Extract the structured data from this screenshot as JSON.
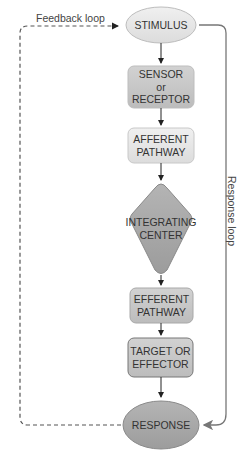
{
  "diagram": {
    "nodes": [
      {
        "id": "stimulus",
        "label": "STIMULUS",
        "shape": "ellipse"
      },
      {
        "id": "sensor",
        "label_lines": [
          "SENSOR",
          "or",
          "RECEPTOR"
        ],
        "shape": "rounded-rect"
      },
      {
        "id": "afferent",
        "label_lines": [
          "AFFERENT",
          "PATHWAY"
        ],
        "shape": "rounded-rect"
      },
      {
        "id": "integrating",
        "label_lines": [
          "INTEGRATING",
          "CENTER"
        ],
        "shape": "diamond"
      },
      {
        "id": "efferent",
        "label_lines": [
          "EFFERENT",
          "PATHWAY"
        ],
        "shape": "rounded-rect"
      },
      {
        "id": "target",
        "label_lines": [
          "TARGET OR",
          "EFFECTOR"
        ],
        "shape": "rounded-rect"
      },
      {
        "id": "response",
        "label": "RESPONSE",
        "shape": "ellipse"
      }
    ],
    "loops": {
      "feedback": "Feedback loop",
      "response": "Response loop"
    },
    "colors": {
      "light_fill": "#e6e6e6",
      "mid_fill": "#c4c4c4",
      "dark_fill": "#a8a8a8",
      "stroke": "#8a8a8a",
      "arrow": "#222222",
      "loop_line": "#777777"
    }
  }
}
